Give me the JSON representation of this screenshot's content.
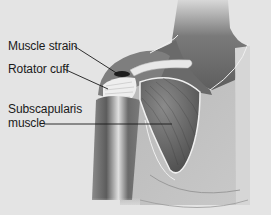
{
  "diagram": {
    "type": "anatomical-illustration",
    "colors": {
      "background": "#e4e4e4",
      "skin_dark": "#6e6e6e",
      "skin_mid": "#a6a6a6",
      "skin_light": "#c8c8c8",
      "muscle": "#5a5a5a",
      "highlight": "#f2f2f2",
      "leader_line": "#1a1a1a"
    },
    "labels": [
      {
        "id": "muscle-strain",
        "lines": [
          "Muscle strain"
        ]
      },
      {
        "id": "rotator-cuff",
        "lines": [
          "Rotator cuff"
        ]
      },
      {
        "id": "subscapularis",
        "lines": [
          "Subscapularis",
          "muscle"
        ]
      }
    ]
  }
}
